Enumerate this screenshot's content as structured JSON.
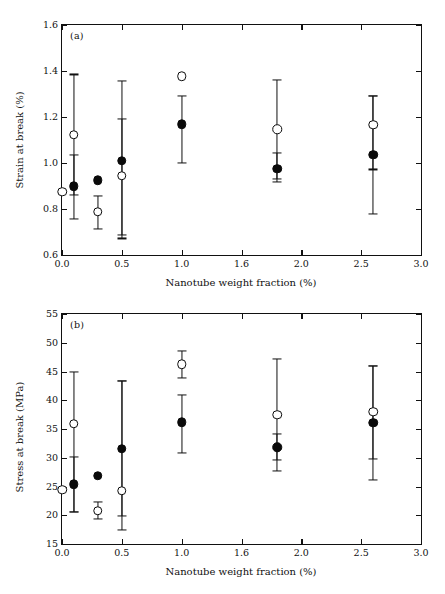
{
  "figure": {
    "panels": [
      "a",
      "b"
    ],
    "shared_xlabel": "Nanotube weight fraction (%)",
    "marker_colors": {
      "filled": "#0a0a0a",
      "open_edge": "#0a0a0a",
      "open_face": "#ffffff"
    }
  },
  "chart_data": [
    {
      "type": "scatter",
      "panel_label": "(a)",
      "title": "",
      "xlabel": "Nanotube weight fraction (%)",
      "ylabel": "Strain at break (%)",
      "xlim": [
        0.0,
        3.0
      ],
      "ylim": [
        0.6,
        1.6
      ],
      "xticks": [
        0.0,
        0.5,
        1.0,
        1.5,
        2.0,
        2.5,
        3.0
      ],
      "xticklabels": [
        "0.0",
        "0.5",
        "1.0",
        "1.6",
        "2.0",
        "2.5",
        "3.0"
      ],
      "yticks": [
        0.6,
        0.8,
        1.0,
        1.2,
        1.4,
        1.6
      ],
      "yticklabels": [
        "0.6",
        "0.8",
        "1.0",
        "1.2",
        "1.4",
        "1.6"
      ],
      "grid": false,
      "legend": "none",
      "series": [
        {
          "name": "open-circle-series",
          "marker": "open-circle",
          "points": [
            {
              "x": 0.0,
              "y": 0.875,
              "yerr_low": null,
              "yerr_high": null
            },
            {
              "x": 0.1,
              "y": 1.122,
              "yerr_low": 0.755,
              "yerr_high": 1.385
            },
            {
              "x": 0.3,
              "y": 0.787,
              "yerr_low": 0.712,
              "yerr_high": 0.857
            },
            {
              "x": 0.5,
              "y": 0.945,
              "yerr_low": 0.672,
              "yerr_high": 1.192
            },
            {
              "x": 1.0,
              "y": 1.378,
              "yerr_low": null,
              "yerr_high": null
            },
            {
              "x": 1.8,
              "y": 1.147,
              "yerr_low": 0.932,
              "yerr_high": 1.363
            },
            {
              "x": 2.6,
              "y": 1.166,
              "yerr_low": 0.972,
              "yerr_high": 1.293
            }
          ]
        },
        {
          "name": "filled-circle-series",
          "marker": "filled-circle",
          "points": [
            {
              "x": 0.1,
              "y": 0.898,
              "yerr_low": 0.862,
              "yerr_high": 1.035
            },
            {
              "x": 0.3,
              "y": 0.925,
              "yerr_low": null,
              "yerr_high": null
            },
            {
              "x": 0.5,
              "y": 1.01,
              "yerr_low": 0.688,
              "yerr_high": 1.358
            },
            {
              "x": 1.0,
              "y": 1.168,
              "yerr_low": 1.002,
              "yerr_high": 1.293
            },
            {
              "x": 1.8,
              "y": 0.975,
              "yerr_low": 0.918,
              "yerr_high": 1.043
            },
            {
              "x": 2.6,
              "y": 1.035,
              "yerr_low": 0.778,
              "yerr_high": 1.29
            }
          ]
        }
      ]
    },
    {
      "type": "scatter",
      "panel_label": "(b)",
      "title": "",
      "xlabel": "Nanotube weight fraction (%)",
      "ylabel": "Stress at break (MPa)",
      "xlim": [
        0.0,
        3.0
      ],
      "ylim": [
        15,
        55
      ],
      "xticks": [
        0.0,
        0.5,
        1.0,
        1.5,
        2.0,
        2.5,
        3.0
      ],
      "xticklabels": [
        "0.0",
        "0.5",
        "1.0",
        "1.6",
        "2.0",
        "2.5",
        "3.0"
      ],
      "yticks": [
        15,
        20,
        25,
        30,
        35,
        40,
        45,
        50,
        55
      ],
      "yticklabels": [
        "15",
        "20",
        "25",
        "30",
        "35",
        "40",
        "45",
        "50",
        "55"
      ],
      "grid": false,
      "legend": "none",
      "series": [
        {
          "name": "open-circle-series",
          "marker": "open-circle",
          "points": [
            {
              "x": 0.0,
              "y": 24.4,
              "yerr_low": null,
              "yerr_high": null
            },
            {
              "x": 0.1,
              "y": 35.9,
              "yerr_low": 20.6,
              "yerr_high": 45.0
            },
            {
              "x": 0.3,
              "y": 20.8,
              "yerr_low": 19.3,
              "yerr_high": 22.3
            },
            {
              "x": 0.5,
              "y": 24.3,
              "yerr_low": 17.5,
              "yerr_high": 43.4
            },
            {
              "x": 1.0,
              "y": 46.3,
              "yerr_low": 43.9,
              "yerr_high": 48.6
            },
            {
              "x": 1.8,
              "y": 37.5,
              "yerr_low": 27.7,
              "yerr_high": 47.2
            },
            {
              "x": 2.6,
              "y": 38.0,
              "yerr_low": 26.1,
              "yerr_high": 46.0
            }
          ]
        },
        {
          "name": "filled-circle-series",
          "marker": "filled-circle",
          "points": [
            {
              "x": 0.1,
              "y": 25.4,
              "yerr_low": 20.6,
              "yerr_high": 30.2
            },
            {
              "x": 0.3,
              "y": 26.9,
              "yerr_low": null,
              "yerr_high": null
            },
            {
              "x": 0.5,
              "y": 31.6,
              "yerr_low": 19.9,
              "yerr_high": 43.4
            },
            {
              "x": 1.0,
              "y": 36.2,
              "yerr_low": 30.8,
              "yerr_high": 41.0
            },
            {
              "x": 1.8,
              "y": 31.8,
              "yerr_low": 29.6,
              "yerr_high": 34.2
            },
            {
              "x": 2.6,
              "y": 36.1,
              "yerr_low": 29.8,
              "yerr_high": 46.0
            }
          ]
        }
      ]
    }
  ]
}
